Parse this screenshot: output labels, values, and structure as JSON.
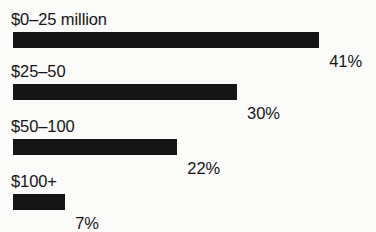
{
  "chart_data": {
    "type": "bar",
    "orientation": "horizontal",
    "title": "",
    "xlabel": "",
    "ylabel": "",
    "grid": false,
    "legend": null,
    "xlim": [
      0,
      41
    ],
    "value_suffix": "%",
    "categories": [
      "$0–25 million",
      "$25–50",
      "$50–100",
      "$100+"
    ],
    "values": [
      41,
      30,
      22,
      7
    ],
    "value_labels": [
      "41%",
      "30%",
      "22%",
      "7%"
    ],
    "bar_color": "#151515",
    "background_color": "#fbfbfa",
    "text_color": "#141414",
    "bars": [
      {
        "label": "$0–25 million",
        "value": 41,
        "value_label": "41%"
      },
      {
        "label": "$25–50",
        "value": 30,
        "value_label": "30%"
      },
      {
        "label": "$50–100",
        "value": 22,
        "value_label": "22%"
      },
      {
        "label": "$100+",
        "value": 7,
        "value_label": "7%"
      }
    ]
  }
}
